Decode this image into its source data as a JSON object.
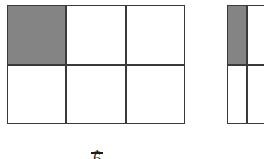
{
  "figure": {
    "type": "fraction-area-model",
    "background_color": "#ffffff",
    "line_color": "#3a3a3a",
    "shade_color": "#848484",
    "empty_color": "#ffffff"
  },
  "models": [
    {
      "name": "left-area-model",
      "columns": 3,
      "rows": 2,
      "total_cells": 6,
      "shaded_cells": 1,
      "fraction_text": "1/6",
      "clipped": false,
      "cells": [
        {
          "index": 1,
          "row": 1,
          "column": 1,
          "state": "shaded"
        },
        {
          "index": 2,
          "row": 1,
          "column": 2,
          "state": "empty"
        },
        {
          "index": 3,
          "row": 1,
          "column": 3,
          "state": "empty"
        },
        {
          "index": 4,
          "row": 2,
          "column": 1,
          "state": "empty"
        },
        {
          "index": 5,
          "row": 2,
          "column": 2,
          "state": "empty"
        },
        {
          "index": 6,
          "row": 2,
          "column": 3,
          "state": "empty"
        }
      ]
    },
    {
      "name": "right-area-model",
      "columns": 3,
      "rows": 2,
      "total_cells": 6,
      "shaded_cells": 1,
      "clipped": true,
      "clip_note": "cut off by right edge of image; only first column visible",
      "cells": [
        {
          "index": 1,
          "row": 1,
          "column": 1,
          "state": "shaded"
        },
        {
          "index": 2,
          "row": 1,
          "column": 2,
          "state": "empty"
        },
        {
          "index": 3,
          "row": 1,
          "column": 3,
          "state": "empty"
        },
        {
          "index": 4,
          "row": 2,
          "column": 1,
          "state": "empty"
        },
        {
          "index": 5,
          "row": 2,
          "column": 2,
          "state": "empty"
        },
        {
          "index": 6,
          "row": 2,
          "column": 3,
          "state": "empty"
        }
      ]
    }
  ],
  "caption": {
    "name": "left-model-caption",
    "numerator": "1",
    "denominator": "6",
    "clipped": true,
    "clip_note": "only the top edge of the glyph and the fraction rule are visible at the bottom border"
  }
}
